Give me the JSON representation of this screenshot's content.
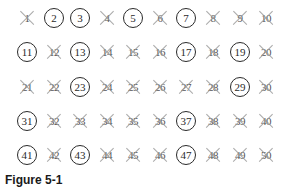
{
  "figure": {
    "caption": "Figure 5-1",
    "colors": {
      "text": "#2a2a2a",
      "cross": "#9a9a9a",
      "circle": "#2a2a2a"
    }
  },
  "rows": [
    [
      {
        "n": "1",
        "mark": "cross"
      },
      {
        "n": "2",
        "mark": "circle"
      },
      {
        "n": "3",
        "mark": "circle"
      },
      {
        "n": "4",
        "mark": "cross"
      },
      {
        "n": "5",
        "mark": "circle"
      },
      {
        "n": "6",
        "mark": "cross"
      },
      {
        "n": "7",
        "mark": "circle"
      },
      {
        "n": "8",
        "mark": "cross"
      },
      {
        "n": "9",
        "mark": "cross"
      },
      {
        "n": "10",
        "mark": "cross"
      }
    ],
    [
      {
        "n": "11",
        "mark": "circle"
      },
      {
        "n": "12",
        "mark": "cross"
      },
      {
        "n": "13",
        "mark": "circle"
      },
      {
        "n": "14",
        "mark": "cross"
      },
      {
        "n": "15",
        "mark": "cross"
      },
      {
        "n": "16",
        "mark": "cross"
      },
      {
        "n": "17",
        "mark": "circle"
      },
      {
        "n": "18",
        "mark": "cross"
      },
      {
        "n": "19",
        "mark": "circle"
      },
      {
        "n": "20",
        "mark": "cross"
      }
    ],
    [
      {
        "n": "21",
        "mark": "cross"
      },
      {
        "n": "22",
        "mark": "cross"
      },
      {
        "n": "23",
        "mark": "circle"
      },
      {
        "n": "24",
        "mark": "cross"
      },
      {
        "n": "25",
        "mark": "cross"
      },
      {
        "n": "26",
        "mark": "cross"
      },
      {
        "n": "27",
        "mark": "cross"
      },
      {
        "n": "28",
        "mark": "cross"
      },
      {
        "n": "29",
        "mark": "circle"
      },
      {
        "n": "30",
        "mark": "cross"
      }
    ],
    [
      {
        "n": "31",
        "mark": "circle"
      },
      {
        "n": "32",
        "mark": "cross"
      },
      {
        "n": "33",
        "mark": "cross"
      },
      {
        "n": "34",
        "mark": "cross"
      },
      {
        "n": "35",
        "mark": "cross"
      },
      {
        "n": "36",
        "mark": "cross"
      },
      {
        "n": "37",
        "mark": "circle"
      },
      {
        "n": "38",
        "mark": "cross"
      },
      {
        "n": "39",
        "mark": "cross"
      },
      {
        "n": "40",
        "mark": "cross"
      }
    ],
    [
      {
        "n": "41",
        "mark": "circle"
      },
      {
        "n": "42",
        "mark": "cross"
      },
      {
        "n": "43",
        "mark": "circle"
      },
      {
        "n": "44",
        "mark": "cross"
      },
      {
        "n": "45",
        "mark": "cross"
      },
      {
        "n": "46",
        "mark": "cross"
      },
      {
        "n": "47",
        "mark": "circle"
      },
      {
        "n": "48",
        "mark": "cross"
      },
      {
        "n": "49",
        "mark": "cross"
      },
      {
        "n": "50",
        "mark": "cross"
      }
    ]
  ],
  "primes": [
    "2",
    "3",
    "5",
    "7",
    "11",
    "13",
    "17",
    "19",
    "23",
    "29",
    "31",
    "37",
    "41",
    "43",
    "47"
  ]
}
